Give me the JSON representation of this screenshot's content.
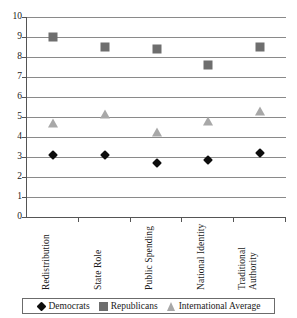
{
  "chart_data": {
    "type": "scatter",
    "title": "",
    "subtitle": "",
    "xlabel": "",
    "ylabel": "",
    "ylim": [
      0,
      10
    ],
    "ytick_labels": [
      "10",
      "9",
      "8",
      "7",
      "6",
      "5",
      "4",
      "3",
      "2",
      "1",
      "0"
    ],
    "yticks": [
      10,
      9,
      8,
      7,
      6,
      5,
      4,
      3,
      2,
      1,
      0
    ],
    "grid": true,
    "legend_position": "bottom",
    "categories": [
      "Redistribution",
      "State Role",
      "Public Spending",
      "National Identity",
      "Traditional Authority"
    ],
    "series": [
      {
        "name": "Democrats",
        "marker": "diamond",
        "color": "#0d0d0d",
        "values": [
          3.1,
          3.1,
          2.7,
          2.85,
          3.2
        ]
      },
      {
        "name": "Republicans",
        "marker": "square",
        "color": "#6e6e6e",
        "values": [
          9.0,
          8.5,
          8.4,
          7.6,
          8.5
        ]
      },
      {
        "name": "International Average",
        "marker": "triangle",
        "color": "#a8a8a8",
        "values": [
          4.65,
          5.1,
          4.2,
          4.75,
          5.25
        ]
      }
    ]
  },
  "legend": {
    "entries": [
      {
        "label": "Democrats",
        "marker": "diamond"
      },
      {
        "label": "Republicans",
        "marker": "square"
      },
      {
        "label": "International Average",
        "marker": "triangle"
      }
    ]
  },
  "axes": {
    "y_axis_name": "value-axis",
    "x_axis_name": "category-axis"
  }
}
